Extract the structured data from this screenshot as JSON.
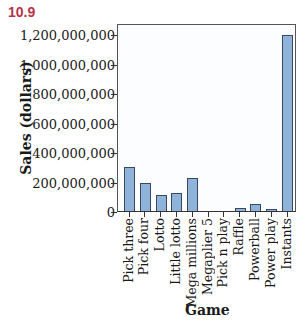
{
  "figure_number": "10.9",
  "chart_data": {
    "type": "bar",
    "title": "",
    "xlabel": "Game",
    "ylabel": "Sales (dollars)",
    "ylim": [
      0,
      1270000000
    ],
    "yticks": [
      0,
      200000000,
      400000000,
      600000000,
      800000000,
      1000000000,
      1200000000
    ],
    "ytick_labels": [
      "0",
      "200,000,000",
      "400,000,000",
      "600,000,000",
      "800,000,000",
      "1,000,000,000",
      "1,200,000,000"
    ],
    "categories": [
      "Pick three",
      "Pick four",
      "Lotto",
      "Little lotto",
      "Mega millions",
      "Megaplier 5",
      "Pick n play",
      "Raffle",
      "Powerball",
      "Power play",
      "Instants"
    ],
    "values": [
      300000000,
      190000000,
      108000000,
      122000000,
      224000000,
      0,
      0,
      20000000,
      45000000,
      12000000,
      1190000000
    ],
    "grid": false,
    "legend": null,
    "bar_color": "#8fb3db",
    "edge_color": "#3a4a5e"
  }
}
